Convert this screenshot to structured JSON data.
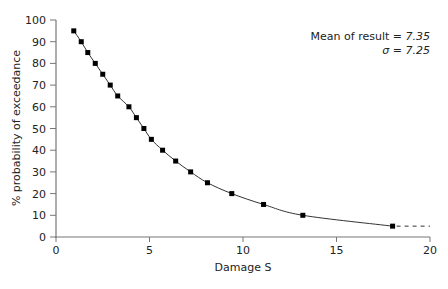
{
  "chart_data": {
    "type": "line",
    "title": "",
    "xlabel": "Damage S",
    "ylabel": "% probability of exceedance",
    "xlim": [
      0,
      20
    ],
    "ylim": [
      0,
      100
    ],
    "xticks": [
      0,
      5,
      10,
      15,
      20
    ],
    "yticks": [
      0,
      10,
      20,
      30,
      40,
      50,
      60,
      70,
      80,
      90,
      100
    ],
    "grid": false,
    "legend": null,
    "series": [
      {
        "name": "exceedance",
        "marker": "square",
        "x": [
          0.95,
          1.35,
          1.7,
          2.1,
          2.5,
          2.9,
          3.3,
          3.9,
          4.3,
          4.7,
          5.1,
          5.7,
          6.4,
          7.2,
          8.1,
          9.4,
          11.1,
          13.2,
          18.0
        ],
        "y": [
          95,
          90,
          85,
          80,
          75,
          70,
          65,
          60,
          55,
          50,
          45,
          40,
          35,
          30,
          25,
          20,
          15,
          10,
          5
        ]
      }
    ],
    "extension": {
      "style": "dashed",
      "from": [
        18.0,
        5
      ],
      "to": [
        20,
        5
      ]
    },
    "annotations": [
      {
        "text": "Mean of result = 7.35"
      },
      {
        "text": "σ = 7.25"
      }
    ]
  },
  "annotation": {
    "mean_label": "Mean of result = ",
    "mean_value": "7.35",
    "sigma_label": "σ",
    "sigma_eq": " = ",
    "sigma_value": "7.25"
  },
  "axes": {
    "xlabel": "Damage S",
    "ylabel": "% probability of exceedance"
  }
}
